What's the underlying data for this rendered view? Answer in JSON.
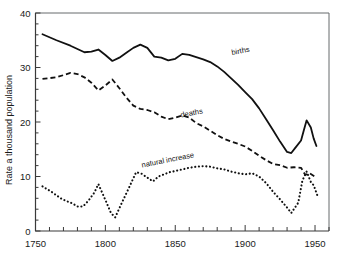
{
  "chart_data": {
    "type": "line",
    "title": "",
    "subtitle": "",
    "xlabel": "",
    "ylabel": "Rate a thousand population",
    "xlim": [
      1750,
      1960
    ],
    "ylim": [
      0,
      40
    ],
    "xticks": [
      1750,
      1800,
      1850,
      1900,
      1950
    ],
    "xtick_labels": [
      "1750",
      "1800",
      "1850",
      "1900",
      "1950"
    ],
    "xminor_step": 10,
    "yticks": [
      0,
      10,
      20,
      30,
      40
    ],
    "ytick_labels": [
      "0",
      "10",
      "20",
      "30",
      "40"
    ],
    "yminor_step": 2,
    "grid": false,
    "legend_position": "inline-annotations",
    "annotations": [
      {
        "text": "births",
        "x": 1897,
        "y": 32.6
      },
      {
        "text": "deaths",
        "x": 1862,
        "y": 21.2
      },
      {
        "text": "natural increase",
        "x": 1845,
        "y": 12.6
      }
    ],
    "series": [
      {
        "name": "births",
        "style": "solid",
        "x": [
          1755,
          1765,
          1775,
          1785,
          1790,
          1795,
          1800,
          1805,
          1810,
          1815,
          1820,
          1825,
          1830,
          1835,
          1840,
          1845,
          1850,
          1855,
          1860,
          1865,
          1870,
          1875,
          1880,
          1885,
          1890,
          1895,
          1900,
          1905,
          1910,
          1915,
          1920,
          1925,
          1930,
          1933,
          1936,
          1940,
          1942,
          1944,
          1947,
          1949,
          1951
        ],
        "values": [
          36.1,
          35.0,
          34.0,
          32.8,
          32.9,
          33.3,
          32.3,
          31.2,
          31.8,
          32.7,
          33.6,
          34.2,
          33.6,
          32.0,
          31.8,
          31.3,
          31.6,
          32.5,
          32.3,
          31.9,
          31.5,
          31.0,
          30.2,
          29.2,
          28.0,
          26.8,
          25.5,
          24.2,
          22.5,
          20.5,
          18.5,
          16.4,
          14.5,
          14.3,
          15.3,
          16.6,
          18.5,
          20.3,
          19.0,
          17.0,
          15.6
        ]
      },
      {
        "name": "deaths",
        "style": "dashed",
        "x": [
          1755,
          1765,
          1775,
          1780,
          1785,
          1790,
          1795,
          1800,
          1805,
          1810,
          1815,
          1820,
          1825,
          1830,
          1835,
          1840,
          1845,
          1850,
          1855,
          1860,
          1865,
          1870,
          1875,
          1880,
          1885,
          1890,
          1895,
          1900,
          1905,
          1910,
          1915,
          1920,
          1925,
          1930,
          1935,
          1940,
          1943,
          1946,
          1951
        ],
        "values": [
          27.9,
          28.2,
          29.0,
          28.8,
          28.2,
          27.2,
          25.8,
          26.7,
          27.8,
          26.2,
          24.5,
          23.0,
          22.4,
          22.2,
          21.8,
          21.0,
          20.5,
          20.8,
          21.2,
          20.8,
          19.8,
          19.2,
          18.4,
          17.6,
          16.9,
          16.4,
          16.0,
          15.5,
          14.7,
          13.8,
          13.0,
          12.3,
          12.1,
          11.6,
          11.7,
          11.6,
          10.3,
          10.6,
          9.8
        ]
      },
      {
        "name": "natural increase",
        "style": "dotted",
        "x": [
          1755,
          1762,
          1768,
          1772,
          1776,
          1780,
          1784,
          1788,
          1792,
          1795,
          1800,
          1804,
          1807,
          1812,
          1817,
          1822,
          1826,
          1830,
          1834,
          1838,
          1842,
          1846,
          1850,
          1855,
          1860,
          1865,
          1870,
          1875,
          1880,
          1885,
          1890,
          1895,
          1900,
          1905,
          1910,
          1915,
          1920,
          1925,
          1930,
          1933,
          1938,
          1941,
          1944,
          1947,
          1949,
          1952
        ],
        "values": [
          8.2,
          7.1,
          6.0,
          5.5,
          5.1,
          4.5,
          4.5,
          5.6,
          7.0,
          8.6,
          5.7,
          3.3,
          2.5,
          5.3,
          8.0,
          10.8,
          10.5,
          9.8,
          9.1,
          10.0,
          10.4,
          10.8,
          11.0,
          11.3,
          11.6,
          11.8,
          11.9,
          11.8,
          11.5,
          11.3,
          10.9,
          10.6,
          10.4,
          10.6,
          10.0,
          8.8,
          7.2,
          5.8,
          4.3,
          3.3,
          5.2,
          9.3,
          10.9,
          9.0,
          8.4,
          6.3
        ]
      }
    ]
  }
}
